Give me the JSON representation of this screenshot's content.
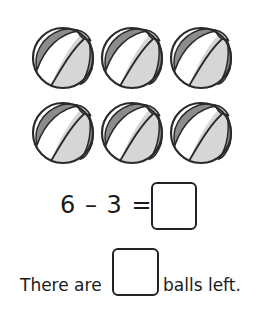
{
  "balls": {
    "count": 6,
    "rows": 2,
    "columns": 3,
    "colors": {
      "outline": "#2a2a2a",
      "dark_panel": "#8c8c8c",
      "light_panel": "#d6d6d6",
      "white_panel": "#ffffff"
    }
  },
  "equation": {
    "minuend": "6",
    "operator": "–",
    "subtrahend": "3",
    "equals": "=",
    "text": "6 – 3 =",
    "answer": ""
  },
  "sentence": {
    "before": "There are",
    "answer": "",
    "after": "balls left."
  }
}
